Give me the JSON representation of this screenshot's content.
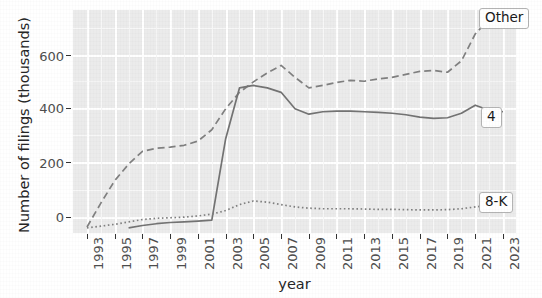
{
  "chart_data": {
    "type": "line",
    "title": "",
    "xlabel": "year",
    "ylabel": "Number of filings (thousands)",
    "xlim": [
      1993,
      2023
    ],
    "ylim": [
      -15,
      730
    ],
    "grid": true,
    "legend_position": "right-inline-labels",
    "xticks": [
      1993,
      1995,
      1997,
      1999,
      2001,
      2003,
      2005,
      2007,
      2009,
      2011,
      2013,
      2015,
      2017,
      2019,
      2021,
      2023
    ],
    "xtick_labels": [
      "1993",
      "1995",
      "1997",
      "1999",
      "2001",
      "2003",
      "2005",
      "2007",
      "2009",
      "2011",
      "2013",
      "2015",
      "2017",
      "2019",
      "2021",
      "2023"
    ],
    "yticks": [
      0,
      200,
      400,
      600
    ],
    "ytick_labels": [
      "0",
      "200",
      "400",
      "600"
    ],
    "x": [
      1993,
      1994,
      1995,
      1996,
      1997,
      1998,
      1999,
      2000,
      2001,
      2002,
      2003,
      2004,
      2005,
      2006,
      2007,
      2008,
      2009,
      2010,
      2011,
      2012,
      2013,
      2014,
      2015,
      2016,
      2017,
      2018,
      2019,
      2020,
      2021,
      2022,
      2023
    ],
    "series": [
      {
        "name": "Other",
        "style": "dashed",
        "color": "#808080",
        "label": "Other",
        "values": [
          5,
          85,
          160,
          215,
          258,
          268,
          272,
          278,
          292,
          330,
          400,
          455,
          490,
          520,
          545,
          505,
          470,
          478,
          488,
          495,
          492,
          500,
          505,
          515,
          525,
          528,
          522,
          560,
          650,
          700,
          685
        ]
      },
      {
        "name": "4",
        "style": "solid",
        "color": "#737373",
        "label": "4",
        "values": [
          null,
          null,
          null,
          2,
          10,
          16,
          20,
          22,
          25,
          28,
          300,
          470,
          478,
          470,
          455,
          400,
          382,
          390,
          392,
          392,
          390,
          388,
          385,
          380,
          372,
          368,
          370,
          385,
          412,
          395,
          390
        ]
      },
      {
        "name": "8-K",
        "style": "dotted",
        "color": "#808080",
        "label": "8-K",
        "values": [
          2,
          8,
          14,
          22,
          30,
          34,
          36,
          38,
          42,
          48,
          60,
          80,
          92,
          88,
          80,
          72,
          68,
          66,
          66,
          66,
          65,
          64,
          64,
          63,
          62,
          62,
          63,
          66,
          72,
          78,
          80
        ]
      }
    ],
    "annotations": [
      {
        "text": "Other",
        "at_x": 2023,
        "at_y": 685
      },
      {
        "text": "4",
        "at_x": 2023,
        "at_y": 390
      },
      {
        "text": "8-K",
        "at_x": 2023,
        "at_y": 80
      }
    ],
    "colors": {
      "panel_background": "#ebebeb",
      "grid_major": "#ffffff",
      "line": "#7a7a7a",
      "text": "#262626",
      "tick_text": "#4d4d4d"
    }
  }
}
